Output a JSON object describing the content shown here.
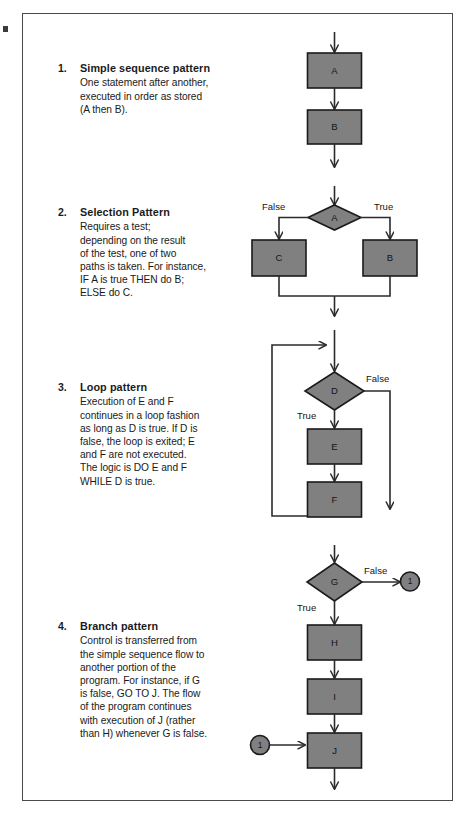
{
  "page": {
    "frame_color": "#4a4a4a",
    "shape_fill": "#808080",
    "shape_stroke": "#1a1a1a",
    "line_color": "#2b2b2b"
  },
  "items": [
    {
      "number": "1.",
      "title": "Simple sequence pattern",
      "text": "One statement after another,\nexecuted in order as stored\n(A then B)."
    },
    {
      "number": "2.",
      "title": "Selection Pattern",
      "text": "Requires a test;\ndepending on the result\nof the test, one of two\npaths is taken. For instance,\nIF A is true THEN do B;\nELSE do C."
    },
    {
      "number": "3.",
      "title": "Loop pattern",
      "text": "Execution of E and F\ncontinues in a loop fashion\nas long as D is true. If D is\nfalse, the loop is exited; E\nand F are not executed.\nThe logic is DO E and F\nWHILE D is true."
    },
    {
      "number": "4.",
      "title": "Branch pattern",
      "text": "Control is transferred from\nthe simple sequence flow to\nanother portion of the\nprogram. For instance, if G\nis false, GO TO J. The flow\nof the program continues\nwith execution of J (rather\nthan H) whenever G is false."
    }
  ],
  "diagrams": {
    "sequence": {
      "nodes": [
        {
          "id": "A",
          "label": "A",
          "shape": "process"
        },
        {
          "id": "B",
          "label": "B",
          "shape": "process"
        }
      ],
      "edge_labels": []
    },
    "selection": {
      "nodes": [
        {
          "id": "A",
          "label": "A",
          "shape": "decision"
        },
        {
          "id": "C",
          "label": "C",
          "shape": "process"
        },
        {
          "id": "B",
          "label": "B",
          "shape": "process"
        }
      ],
      "edge_labels": [
        {
          "id": "false-left",
          "label": "False"
        },
        {
          "id": "true-right",
          "label": "True"
        }
      ]
    },
    "loop": {
      "nodes": [
        {
          "id": "D",
          "label": "D",
          "shape": "decision"
        },
        {
          "id": "E",
          "label": "E",
          "shape": "process"
        },
        {
          "id": "F",
          "label": "F",
          "shape": "process"
        }
      ],
      "edge_labels": [
        {
          "id": "false-right",
          "label": "False"
        },
        {
          "id": "true-down",
          "label": "True"
        }
      ]
    },
    "branch": {
      "nodes": [
        {
          "id": "G",
          "label": "G",
          "shape": "decision"
        },
        {
          "id": "H",
          "label": "H",
          "shape": "process"
        },
        {
          "id": "I",
          "label": "I",
          "shape": "process"
        },
        {
          "id": "J",
          "label": "J",
          "shape": "process"
        },
        {
          "id": "conn-out",
          "label": "1",
          "shape": "connector"
        },
        {
          "id": "conn-in",
          "label": "1",
          "shape": "connector"
        }
      ],
      "edge_labels": [
        {
          "id": "false-right",
          "label": "False"
        },
        {
          "id": "true-down",
          "label": "True"
        }
      ]
    }
  }
}
